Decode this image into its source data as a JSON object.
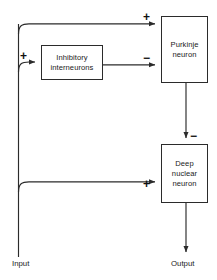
{
  "diagram": {
    "nodes": [
      {
        "id": "purkinje",
        "label": "Purkinje\nneuron"
      },
      {
        "id": "interneurons",
        "label": "Inhibitory\ninterneurons"
      },
      {
        "id": "deep",
        "label": "Deep\nnuclear\nneuron"
      }
    ],
    "signs": {
      "purkinje_excitatory": "+",
      "purkinje_inhibitory": "−",
      "interneuron_excitatory": "+",
      "deep_inhibitory": "−",
      "deep_excitatory": "+"
    },
    "endpoints": {
      "input": "Input",
      "output": "Output"
    },
    "colors": {
      "line": "#2b2b2b",
      "box_border": "#2b2b2b",
      "box_fill": "#ffffff",
      "text": "#1a1a1a",
      "background": "#ffffff"
    }
  }
}
